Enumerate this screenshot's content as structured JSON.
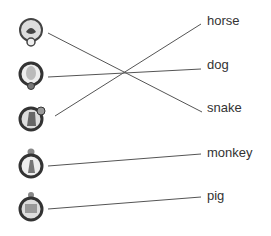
{
  "exercise": {
    "animals_left": [
      {
        "icon": "snake-zodiac-icon",
        "y": 34
      },
      {
        "icon": "dog-zodiac-icon",
        "y": 77
      },
      {
        "icon": "horse-zodiac-icon",
        "y": 120
      },
      {
        "icon": "monkey-zodiac-icon",
        "y": 163
      },
      {
        "icon": "pig-zodiac-icon",
        "y": 206
      }
    ],
    "words_right": [
      "horse",
      "dog",
      "snake",
      "monkey",
      "pig"
    ],
    "line_color": "#555555"
  }
}
